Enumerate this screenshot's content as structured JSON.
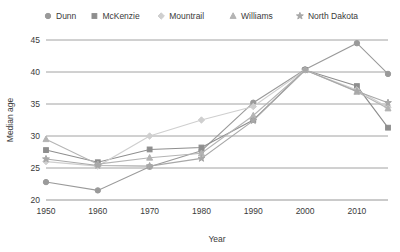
{
  "chart_data": {
    "type": "line",
    "title": "",
    "xlabel": "Year",
    "ylabel": "Median age",
    "xlim": [
      1950,
      2016
    ],
    "ylim": [
      20,
      45
    ],
    "xticks": [
      "1950",
      "1960",
      "1970",
      "1980",
      "1990",
      "2000",
      "2010"
    ],
    "xtick_values": [
      1950,
      1960,
      1970,
      1980,
      1990,
      2000,
      2010
    ],
    "yticks": [
      "20",
      "25",
      "30",
      "35",
      "40",
      "45"
    ],
    "ytick_values": [
      20,
      25,
      30,
      35,
      40,
      45
    ],
    "grid": "horizontal",
    "legend_position": "top",
    "x": [
      1950,
      1960,
      1970,
      1980,
      1990,
      2000,
      2010,
      2016
    ],
    "series": [
      {
        "name": "Dunn",
        "marker": "circle",
        "color": "#9a9a9a",
        "values": [
          22.8,
          21.5,
          25.2,
          27.7,
          35.2,
          40.4,
          44.5,
          39.7
        ]
      },
      {
        "name": "McKenzie",
        "marker": "square",
        "color": "#8e8e8e",
        "values": [
          27.8,
          25.9,
          27.9,
          28.2,
          32.5,
          40.3,
          37.8,
          31.3
        ]
      },
      {
        "name": "Mountrail",
        "marker": "diamond",
        "color": "#cfcfcf",
        "values": [
          26.0,
          25.3,
          30.0,
          32.5,
          34.6,
          40.3,
          37.2,
          34.5
        ]
      },
      {
        "name": "Williams",
        "marker": "triangle",
        "color": "#b4b4b4",
        "values": [
          29.5,
          25.6,
          26.6,
          27.3,
          33.2,
          40.3,
          36.9,
          34.3
        ]
      },
      {
        "name": "North Dakota",
        "marker": "star",
        "color": "#a8a8a8",
        "values": [
          26.4,
          25.4,
          25.3,
          26.5,
          32.4,
          40.3,
          37.0,
          35.2
        ]
      }
    ]
  }
}
